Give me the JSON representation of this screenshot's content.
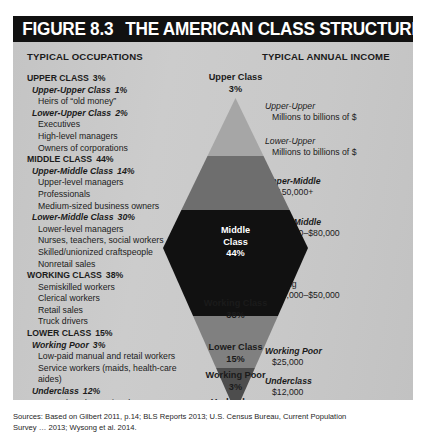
{
  "figure": {
    "number": "FIGURE 8.3",
    "title": "THE AMERICAN CLASS STRUCTURE"
  },
  "columns": {
    "occupations_header": "TYPICAL OCCUPATIONS",
    "income_header": "TYPICAL ANNUAL INCOME"
  },
  "occupations": [
    {
      "level": "major",
      "label": "UPPER CLASS",
      "pct": "3%"
    },
    {
      "level": "sub",
      "label": "Upper-Upper Class",
      "pct": "1%"
    },
    {
      "level": "item",
      "label": "Heirs of “old money”",
      "pct": ""
    },
    {
      "level": "sub",
      "label": "Lower-Upper Class",
      "pct": "2%"
    },
    {
      "level": "item",
      "label": "Executives",
      "pct": ""
    },
    {
      "level": "item",
      "label": "High-level managers",
      "pct": ""
    },
    {
      "level": "item",
      "label": "Owners of corporations",
      "pct": ""
    },
    {
      "level": "major",
      "label": "MIDDLE CLASS",
      "pct": "44%"
    },
    {
      "level": "sub",
      "label": "Upper-Middle Class",
      "pct": "14%"
    },
    {
      "level": "item",
      "label": "Upper-level managers",
      "pct": ""
    },
    {
      "level": "item",
      "label": "Professionals",
      "pct": ""
    },
    {
      "level": "item",
      "label": "Medium-sized business owners",
      "pct": ""
    },
    {
      "level": "sub",
      "label": "Lower-Middle Class",
      "pct": "30%"
    },
    {
      "level": "item",
      "label": "Lower-level managers",
      "pct": ""
    },
    {
      "level": "item",
      "label": "Nurses, teachers, social workers",
      "pct": ""
    },
    {
      "level": "item",
      "label": "Skilled/unionized craftspeople",
      "pct": ""
    },
    {
      "level": "item",
      "label": "Nonretail sales",
      "pct": ""
    },
    {
      "level": "major",
      "label": "WORKING CLASS",
      "pct": "38%"
    },
    {
      "level": "item",
      "label": "Semiskilled workers",
      "pct": ""
    },
    {
      "level": "item",
      "label": "Clerical workers",
      "pct": ""
    },
    {
      "level": "item",
      "label": "Retail sales",
      "pct": ""
    },
    {
      "level": "item",
      "label": "Truck drivers",
      "pct": ""
    },
    {
      "level": "major",
      "label": "LOWER CLASS",
      "pct": "15%"
    },
    {
      "level": "sub",
      "label": "Working Poor",
      "pct": "3%"
    },
    {
      "level": "item",
      "label": "Low-paid manual and retail workers",
      "pct": ""
    },
    {
      "level": "item",
      "label": "Service workers (maids, health-care",
      "pct": ""
    },
    {
      "level": "cont",
      "label": "aides)",
      "pct": ""
    },
    {
      "level": "sub",
      "label": "Underclass",
      "pct": "12%"
    },
    {
      "level": "item",
      "label": "Unemployed, part-time low wage",
      "pct": ""
    },
    {
      "level": "cont",
      "label": "earners, public assistance recipients",
      "pct": ""
    }
  ],
  "incomes": [
    {
      "name": "Upper-Upper",
      "value": "Millions to billions of $",
      "style": "italic",
      "top": 28
    },
    {
      "name": "Lower-Upper",
      "value": "Millions to billions of $",
      "style": "italic",
      "top": 63
    },
    {
      "name": "Upper-Middle",
      "value": "$150,000+",
      "style": "bolditalic",
      "top": 103
    },
    {
      "name": "Lower-Middle",
      "value": "$60,000–$80,000",
      "style": "bolditalic",
      "top": 144
    },
    {
      "name": "Working",
      "value": "$40,000–$50,000",
      "style": "plain",
      "top": 206
    },
    {
      "name": "Working Poor",
      "value": "$25,000",
      "style": "bolditalic",
      "top": 273
    },
    {
      "name": "Underclass",
      "value": "$12,000",
      "style": "bolditalic",
      "top": 303
    }
  ],
  "chart_data": {
    "type": "pie",
    "title": "The American Class Structure",
    "xlabel": "",
    "ylabel": "Share of U.S. population (%)",
    "categories": [
      "Upper Class",
      "Middle Class",
      "Working Class",
      "Lower Class"
    ],
    "values": [
      3,
      44,
      38,
      15
    ],
    "subdivisions": [
      {
        "name": "Upper-Upper Class",
        "value": 1
      },
      {
        "name": "Lower-Upper Class",
        "value": 2
      },
      {
        "name": "Upper-Middle Class",
        "value": 14
      },
      {
        "name": "Lower-Middle Class",
        "value": 30
      },
      {
        "name": "Working Class",
        "value": 38
      },
      {
        "name": "Working Poor",
        "value": 3
      },
      {
        "name": "Underclass",
        "value": 12
      }
    ],
    "legend_position": "none",
    "grid": false
  },
  "diagram": {
    "bands": [
      {
        "name": "Upper Class",
        "pct": "3%",
        "tone": "dark",
        "color": "#a6a6a6",
        "label_top": 22
      },
      {
        "name": "Middle Class",
        "pct": "44%",
        "tone": "light",
        "color": "#111111",
        "label_top": 175
      },
      {
        "name": "Working Class",
        "pct": "38%",
        "tone": "dark",
        "color": "#808080",
        "label_top": 248
      },
      {
        "name": "Lower Class",
        "pct": "15%",
        "tone": "dark",
        "color": "#4d4d4d",
        "label_top": 292
      },
      {
        "name": "Working Poor",
        "pct": "3%",
        "tone": "dark",
        "color": "#9a9a9a",
        "label_top": 320
      },
      {
        "name": "Underclass",
        "pct": "12%",
        "tone": "dark",
        "color": "#9a9a9a",
        "label_top": 347
      }
    ],
    "colors": {
      "upper": "#a6a6a6",
      "upper_mid": "#6e6e6e",
      "middle": "#111111",
      "working": "#808080",
      "lower": "#4d4d4d"
    }
  },
  "sources": {
    "line1": "Sources: Based on Gilbert 2011, p.14; BLS Reports 2013; U.S. Census Bureau, Current Population",
    "line2": "Survey … 2013; Wysong et al. 2014."
  }
}
